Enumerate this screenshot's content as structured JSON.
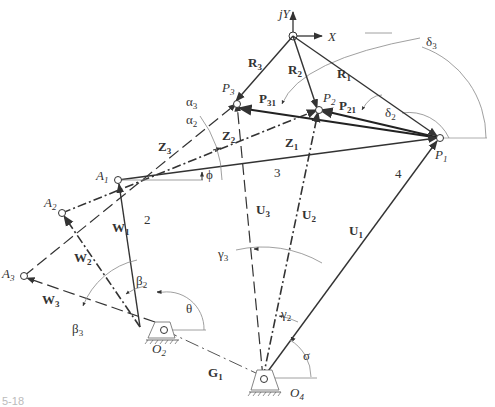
{
  "figure": {
    "caption": "5-18"
  },
  "axes": {
    "x_label": "X",
    "y_label": "jY"
  },
  "points": {
    "P1": {
      "label": "P",
      "sub": "1"
    },
    "P2": {
      "label": "P",
      "sub": "2"
    },
    "P3": {
      "label": "P",
      "sub": "3"
    },
    "A1": {
      "label": "A",
      "sub": "1"
    },
    "A2": {
      "label": "A",
      "sub": "2"
    },
    "A3": {
      "label": "A",
      "sub": "3"
    },
    "O2": {
      "label": "O",
      "sub": "2"
    },
    "O4": {
      "label": "O",
      "sub": "4"
    }
  },
  "vectors": {
    "R1": {
      "label": "R",
      "sub": "1"
    },
    "R2": {
      "label": "R",
      "sub": "2"
    },
    "R3": {
      "label": "R",
      "sub": "3"
    },
    "P21": {
      "label": "P",
      "sub": "21"
    },
    "P31": {
      "label": "P",
      "sub": "31"
    },
    "Z1": {
      "label": "Z",
      "sub": "1"
    },
    "Z2": {
      "label": "Z",
      "sub": "2"
    },
    "Z3": {
      "label": "Z",
      "sub": "3"
    },
    "W1": {
      "label": "W",
      "sub": "1"
    },
    "W2": {
      "label": "W",
      "sub": "2"
    },
    "W3": {
      "label": "W",
      "sub": "3"
    },
    "U1": {
      "label": "U",
      "sub": "1"
    },
    "U2": {
      "label": "U",
      "sub": "2"
    },
    "U3": {
      "label": "U",
      "sub": "3"
    },
    "G1": {
      "label": "G",
      "sub": "1"
    }
  },
  "angles": {
    "delta2": {
      "label": "δ",
      "sub": "2"
    },
    "delta3": {
      "label": "δ",
      "sub": "3"
    },
    "alpha2": {
      "label": "α",
      "sub": "2"
    },
    "alpha3": {
      "label": "α",
      "sub": "3"
    },
    "beta2": {
      "label": "β",
      "sub": "2"
    },
    "beta3": {
      "label": "β",
      "sub": "3"
    },
    "gamma2": {
      "label": "γ",
      "sub": "2"
    },
    "gamma3": {
      "label": "γ",
      "sub": "3"
    },
    "phi": {
      "label": "ϕ"
    },
    "theta": {
      "label": "θ"
    },
    "sigma": {
      "label": "σ"
    }
  },
  "links": {
    "link2": "2",
    "link3": "3",
    "link4": "4"
  }
}
